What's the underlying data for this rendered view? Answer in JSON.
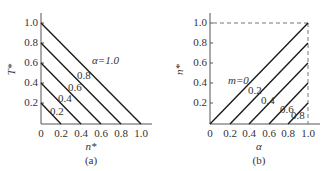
{
  "panel_a": {
    "y_axis_label": "T*",
    "x_axis_label": "n*",
    "caption": "(a)",
    "y_ticks": [
      "0.2",
      "0.4",
      "0.6",
      "0.8",
      "1.0"
    ],
    "x_ticks": [
      "0",
      "0.2",
      "0.4",
      "0.6",
      "0.8",
      "1.0"
    ],
    "curve_param_name": "α",
    "curve_labels": [
      "α=1.0",
      "0.8",
      "0.6",
      "0.4",
      "0.2"
    ]
  },
  "panel_b": {
    "y_axis_label": "n*",
    "x_axis_label": "α",
    "caption": "(b)",
    "y_ticks": [
      "0.2",
      "0.4",
      "0.6",
      "0.8",
      "1.0"
    ],
    "x_ticks": [
      "0",
      "0.2",
      "0.4",
      "0.6",
      "0.8",
      "1.0"
    ],
    "curve_param_name": "m",
    "curve_labels": [
      "m=0",
      "0.2",
      "0.4",
      "0.6",
      "0.8"
    ]
  },
  "colors": {
    "line": "#1a1a1a",
    "axis": "#555555",
    "dashed": "#777777"
  }
}
